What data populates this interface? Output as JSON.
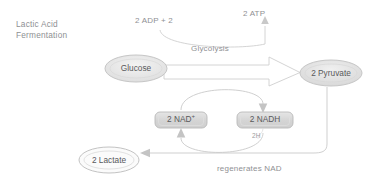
{
  "diagram": {
    "title": "Lactic Acid\nFermentation",
    "type": "pathway-diagram",
    "nodes": [
      {
        "id": "glucose",
        "label": "Glucose",
        "shape": "ellipse",
        "fill": "#e8e8e8"
      },
      {
        "id": "pyruvate",
        "label": "2 Pyruvate",
        "shape": "ellipse",
        "fill": "#e2e2e2"
      },
      {
        "id": "lactate",
        "label": "2 Lactate",
        "shape": "ellipse",
        "fill": "#ffffff"
      },
      {
        "id": "nad",
        "label": "2 NAD",
        "superscript": "+",
        "shape": "rounded-rect",
        "fill": "#d9d9d9"
      },
      {
        "id": "nadh",
        "label": "2 NADH",
        "shape": "rounded-rect",
        "fill": "#d9d9d9"
      }
    ],
    "labels": {
      "adp": "2 ADP + 2",
      "atp": "2 ATP",
      "glycolysis": "Glycolysis",
      "regenerates": "regenerates NAD",
      "protons": "2H"
    },
    "colors": {
      "stroke": "#c9c9c9",
      "text": "#8f9093",
      "node_text": "#58595b",
      "arrow": "#c4c4c4"
    }
  }
}
